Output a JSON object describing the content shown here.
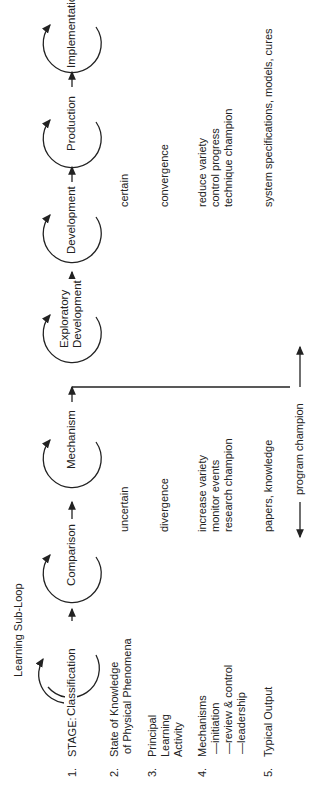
{
  "title": "Learning Sub-Loop",
  "row_labels": [
    {
      "num": "1.",
      "text": "STAGE:"
    },
    {
      "num": "2.",
      "text": "State of Knowledge\n of Physical Phenomena"
    },
    {
      "num": "3.",
      "text": "Principal\nLearning\nActivity"
    },
    {
      "num": "4.",
      "text": "Mechanisms\n —initiation\n —review & control\n —leadership"
    },
    {
      "num": "5.",
      "text": "Typical Output"
    }
  ],
  "stages": [
    {
      "label": "Classification"
    },
    {
      "label": "Comparison"
    },
    {
      "label": "Mechanism"
    },
    {
      "label": "Exploratory\nDevelopment"
    },
    {
      "label": "Development"
    },
    {
      "label": "Production"
    },
    {
      "label": "Implementation"
    }
  ],
  "left_group": {
    "knowledge": "uncertain",
    "activity": "divergence",
    "mechanisms": "increase variety\nmonitor events\nresearch champion",
    "output": "papers, knowledge"
  },
  "right_group": {
    "knowledge": "certain",
    "activity": "convergence",
    "mechanisms": "reduce variety\ncontrol progress\ntechnique champion",
    "output": "system specifications, models, cures"
  },
  "champion": {
    "label": "program champion"
  }
}
